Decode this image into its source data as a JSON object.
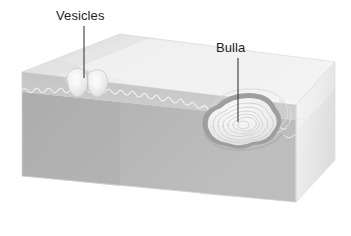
{
  "figure": {
    "type": "medical-illustration",
    "background_color": "#ffffff",
    "width": 351,
    "height": 236
  },
  "labels": {
    "vesicles": "Vesicles",
    "bulla": "Bulla",
    "text_color": "#231f20",
    "leader_line_color": "#3a3a3c"
  },
  "colors": {
    "top_surface": "#e9e9e9",
    "top_surface_light": "#f2f2f2",
    "epidermis_band": "#c9c9c9",
    "dermis_front": "#b3b3b3",
    "dermis_front_dark": "#a8a8a8",
    "right_face": "#f0f0f0",
    "right_face_shadow": "#d8d8d8",
    "junction_line": "#f7f7f7",
    "lesion_fill": "#ebebeb",
    "lesion_shadow": "#a0a0a0",
    "lesion_contour": "#cfcfcf",
    "outline": "#d0d0d0"
  },
  "anatomy": {
    "block": {
      "name": "skin-block",
      "top_face": "epidermal surface",
      "front_face": "cut cross-section",
      "right_face": "cut end"
    },
    "layers": [
      {
        "name": "epidermis",
        "position": "upper band of front face"
      },
      {
        "name": "dermis",
        "position": "lower body of front face"
      }
    ],
    "lesions": [
      {
        "name": "vesicles",
        "count": 2,
        "description": "two small adjacent fluid-filled blisters on the skin surface",
        "x": 80,
        "y": 88
      },
      {
        "name": "bulla",
        "count": 1,
        "description": "single large fluid-filled blister with concentric internal contours",
        "x": 238,
        "y": 126
      }
    ]
  }
}
